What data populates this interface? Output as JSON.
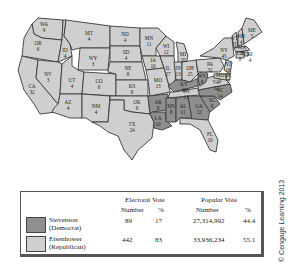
{
  "colors": {
    "stevenson": "#8f8f8f",
    "eisenhower": "#cfcfcf",
    "border": "#3a3a3a",
    "lakes": "#ffffff"
  },
  "map": {
    "states": [
      {
        "abbr": "WA",
        "votes": "9",
        "winner": "eisenhower"
      },
      {
        "abbr": "OR",
        "votes": "6",
        "winner": "eisenhower"
      },
      {
        "abbr": "CA",
        "votes": "32",
        "winner": "eisenhower"
      },
      {
        "abbr": "ID",
        "votes": "4",
        "winner": "eisenhower"
      },
      {
        "abbr": "NV",
        "votes": "3",
        "winner": "eisenhower"
      },
      {
        "abbr": "MT",
        "votes": "4",
        "winner": "eisenhower"
      },
      {
        "abbr": "WY",
        "votes": "3",
        "winner": "eisenhower"
      },
      {
        "abbr": "UT",
        "votes": "4",
        "winner": "eisenhower"
      },
      {
        "abbr": "AZ",
        "votes": "4",
        "winner": "eisenhower"
      },
      {
        "abbr": "CO",
        "votes": "6",
        "winner": "eisenhower"
      },
      {
        "abbr": "NM",
        "votes": "4",
        "winner": "eisenhower"
      },
      {
        "abbr": "ND",
        "votes": "4",
        "winner": "eisenhower"
      },
      {
        "abbr": "SD",
        "votes": "4",
        "winner": "eisenhower"
      },
      {
        "abbr": "NE",
        "votes": "6",
        "winner": "eisenhower"
      },
      {
        "abbr": "KS",
        "votes": "8",
        "winner": "eisenhower"
      },
      {
        "abbr": "OK",
        "votes": "8",
        "winner": "eisenhower"
      },
      {
        "abbr": "TX",
        "votes": "24",
        "winner": "eisenhower"
      },
      {
        "abbr": "MN",
        "votes": "11",
        "winner": "eisenhower"
      },
      {
        "abbr": "IA",
        "votes": "10",
        "winner": "eisenhower"
      },
      {
        "abbr": "MO",
        "votes": "13",
        "winner": "eisenhower"
      },
      {
        "abbr": "AR",
        "votes": "8",
        "winner": "stevenson"
      },
      {
        "abbr": "LA",
        "votes": "10",
        "winner": "stevenson"
      },
      {
        "abbr": "WI",
        "votes": "12",
        "winner": "eisenhower"
      },
      {
        "abbr": "IL",
        "votes": "27",
        "winner": "eisenhower"
      },
      {
        "abbr": "MI",
        "votes": "20",
        "winner": "eisenhower"
      },
      {
        "abbr": "IN",
        "votes": "13",
        "winner": "eisenhower"
      },
      {
        "abbr": "OH",
        "votes": "25",
        "winner": "eisenhower"
      },
      {
        "abbr": "KY",
        "votes": "10",
        "winner": "stevenson"
      },
      {
        "abbr": "TN",
        "votes": "11",
        "winner": "eisenhower"
      },
      {
        "abbr": "MS",
        "votes": "8",
        "winner": "stevenson"
      },
      {
        "abbr": "AL",
        "votes": "11",
        "winner": "stevenson"
      },
      {
        "abbr": "GA",
        "votes": "12",
        "winner": "stevenson"
      },
      {
        "abbr": "FL",
        "votes": "10",
        "winner": "eisenhower"
      },
      {
        "abbr": "SC",
        "votes": "8",
        "winner": "stevenson"
      },
      {
        "abbr": "NC",
        "votes": "14",
        "winner": "stevenson"
      },
      {
        "abbr": "VA",
        "votes": "12",
        "winner": "eisenhower"
      },
      {
        "abbr": "WV",
        "votes": "8",
        "winner": "stevenson"
      },
      {
        "abbr": "PA",
        "votes": "32",
        "winner": "eisenhower"
      },
      {
        "abbr": "NY",
        "votes": "45",
        "winner": "eisenhower"
      },
      {
        "abbr": "VT",
        "votes": "3",
        "winner": "eisenhower"
      },
      {
        "abbr": "NH",
        "votes": "4",
        "winner": "eisenhower"
      },
      {
        "abbr": "ME",
        "votes": "5",
        "winner": "eisenhower"
      },
      {
        "abbr": "MA",
        "votes": "16",
        "winner": "eisenhower"
      },
      {
        "abbr": "RI",
        "votes": "4",
        "winner": "eisenhower"
      },
      {
        "abbr": "CT",
        "votes": "8",
        "winner": "eisenhower"
      },
      {
        "abbr": "NJ",
        "votes": "16",
        "winner": "eisenhower"
      },
      {
        "abbr": "DE",
        "votes": "3",
        "winner": "eisenhower"
      },
      {
        "abbr": "MD",
        "votes": "9",
        "winner": "eisenhower"
      }
    ]
  },
  "legend": {
    "headers": {
      "electoral_vote": "Electoral Vote",
      "popular_vote": "Popular Vote",
      "number": "Number",
      "percent": "%"
    },
    "rows": [
      {
        "name": "Stevenson",
        "party": "(Democrat)",
        "electoral_number": "89",
        "electoral_pct": "17",
        "popular_number": "27,314,992",
        "popular_pct": "44.4"
      },
      {
        "name": "Eisenhower",
        "party": "(Republican)",
        "electoral_number": "442",
        "electoral_pct": "83",
        "popular_number": "33,936,234",
        "popular_pct": "55.1"
      }
    ]
  },
  "credit": "© Cengage Learning 2013"
}
